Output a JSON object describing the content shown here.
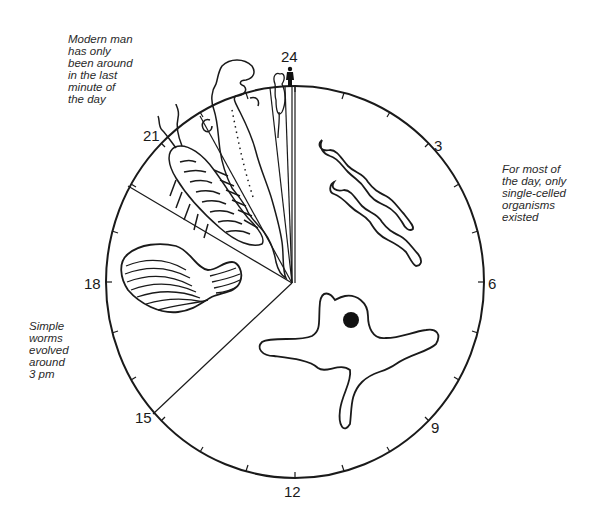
{
  "diagram": {
    "type": "clock-face-timeline",
    "clock": {
      "hour_labels": [
        {
          "value": "24",
          "position": "top"
        },
        {
          "value": "3",
          "position": "upper-right"
        },
        {
          "value": "6",
          "position": "right"
        },
        {
          "value": "9",
          "position": "lower-right"
        },
        {
          "value": "12",
          "position": "bottom"
        },
        {
          "value": "15",
          "position": "lower-left"
        },
        {
          "value": "18",
          "position": "left"
        },
        {
          "value": "21",
          "position": "upper-left"
        }
      ],
      "minor_ticks_per_segment": 2
    },
    "segments": [
      {
        "name": "single-celled-organisms",
        "from_hour": 0,
        "to_hour": 15,
        "illustrations": [
          "bacteria",
          "amoeba"
        ]
      },
      {
        "name": "simple-worms",
        "from_hour": 15,
        "to_hour": 19.5,
        "illustrations": [
          "worm"
        ]
      },
      {
        "name": "arthropods",
        "from_hour": 19.5,
        "to_hour": 21.8,
        "illustrations": [
          "trilobite"
        ]
      },
      {
        "name": "reptiles-dinosaurs",
        "from_hour": 21.8,
        "to_hour": 23.4,
        "illustrations": [
          "dinosaur"
        ]
      },
      {
        "name": "mammals",
        "from_hour": 23.4,
        "to_hour": 23.9,
        "illustrations": [
          "mouse"
        ]
      },
      {
        "name": "modern-man",
        "from_hour": 23.99,
        "to_hour": 24,
        "illustrations": [
          "human"
        ]
      }
    ],
    "captions": {
      "modern_man": "Modern man\nhas only\nbeen around\nin the last\nminute of\nthe day",
      "single_cells": "For most of\nthe day, only\nsingle-celled\norganisms\nexisted",
      "worms": "Simple\nworms\nevolved\naround\n3 pm"
    },
    "colors": {
      "line": "#1a1a1a",
      "text": "#2a2a2a",
      "background": "#ffffff"
    }
  }
}
